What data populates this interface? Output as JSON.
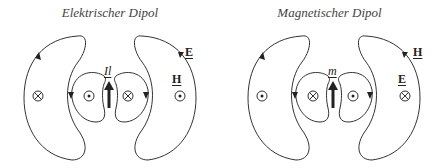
{
  "panels": [
    {
      "title": "Elektrischer Dipol",
      "source_label": "Il",
      "outer_field_label": "E",
      "inner_field_label": "H"
    },
    {
      "title": "Magnetischer Dipol",
      "source_label": "m",
      "outer_field_label": "H",
      "inner_field_label": "E"
    }
  ]
}
